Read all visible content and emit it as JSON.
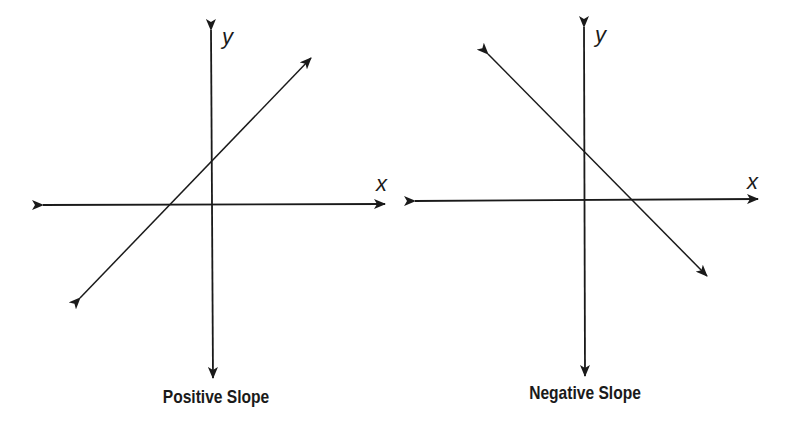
{
  "diagrams": [
    {
      "caption": "Positive Slope",
      "x_label": "x",
      "y_label": "y",
      "line": {
        "slope_sign": "positive",
        "from": [
          80,
          298
        ],
        "to": [
          311,
          58
        ]
      }
    },
    {
      "caption": "Negative Slope",
      "x_label": "x",
      "y_label": "y",
      "line": {
        "slope_sign": "negative",
        "from": [
          488,
          54
        ],
        "to": [
          707,
          276
        ]
      }
    }
  ],
  "colors": {
    "ink": "#1a1a1a",
    "background": "#ffffff"
  }
}
